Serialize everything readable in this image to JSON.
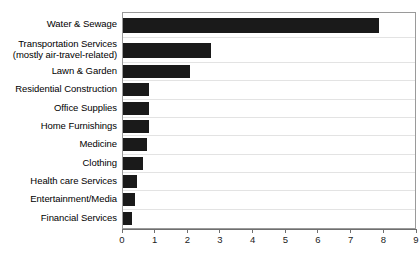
{
  "chart_data": {
    "type": "bar",
    "orientation": "horizontal",
    "title": "",
    "xlabel": "",
    "ylabel": "",
    "xlim": [
      0,
      9
    ],
    "xticks": [
      0,
      1,
      2,
      3,
      4,
      5,
      6,
      7,
      8,
      9
    ],
    "xtick_labels": [
      "0",
      "1",
      "2",
      "3",
      "4",
      "5",
      "6",
      "7",
      "8",
      "9"
    ],
    "grid": false,
    "legend": null,
    "bar_color": "#1a1a1a",
    "frame_color": "#9a9a9a",
    "rowline_color": "#e3e3e3",
    "categories": [
      "Water & Sewage",
      "Transportation Services (mostly air-travel-related)",
      "Lawn & Garden",
      "Residential Construction",
      "Office Supplies",
      "Home Furnishings",
      "Medicine",
      "Clothing",
      "Health care Services",
      "Entertainment/Media",
      "Financial Services"
    ],
    "values": [
      7.9,
      2.7,
      2.05,
      0.8,
      0.8,
      0.8,
      0.75,
      0.63,
      0.42,
      0.37,
      0.28
    ],
    "bars": [
      {
        "label_line1": "Water & Sewage",
        "label_line2": "",
        "value": 7.9,
        "tall": true
      },
      {
        "label_line1": "Transportation Services",
        "label_line2": "(mostly air-travel-related)",
        "value": 2.7,
        "tall": true
      },
      {
        "label_line1": "Lawn & Garden",
        "label_line2": "",
        "value": 2.05,
        "tall": false
      },
      {
        "label_line1": "Residential Construction",
        "label_line2": "",
        "value": 0.8,
        "tall": false
      },
      {
        "label_line1": "Office Supplies",
        "label_line2": "",
        "value": 0.8,
        "tall": false
      },
      {
        "label_line1": "Home Furnishings",
        "label_line2": "",
        "value": 0.8,
        "tall": false
      },
      {
        "label_line1": "Medicine",
        "label_line2": "",
        "value": 0.75,
        "tall": false
      },
      {
        "label_line1": "Clothing",
        "label_line2": "",
        "value": 0.63,
        "tall": false
      },
      {
        "label_line1": "Health care Services",
        "label_line2": "",
        "value": 0.42,
        "tall": false
      },
      {
        "label_line1": "Entertainment/Media",
        "label_line2": "",
        "value": 0.37,
        "tall": false
      },
      {
        "label_line1": "Financial Services",
        "label_line2": "",
        "value": 0.28,
        "tall": false
      }
    ]
  }
}
